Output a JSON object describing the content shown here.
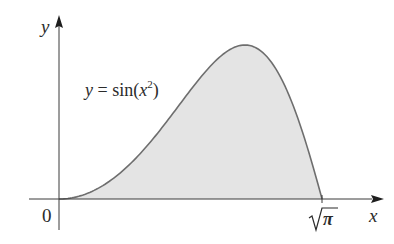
{
  "chart_data": {
    "type": "area",
    "title": "",
    "function_label": "y = sin(x²)",
    "xlabel": "x",
    "ylabel": "y",
    "x_ticks": [
      {
        "value": 0,
        "label": "0"
      },
      {
        "value": 1.7725,
        "label": "√π"
      }
    ],
    "xlim": [
      -0.2,
      2.2
    ],
    "ylim": [
      -0.2,
      1.2
    ],
    "grid": false,
    "legend": null,
    "shaded_region": {
      "from": 0,
      "to": 1.7725,
      "fill": "#e4e4e4"
    },
    "x": [
      0,
      0.2,
      0.4,
      0.6,
      0.8,
      1.0,
      1.2,
      1.2533,
      1.4,
      1.6,
      1.7725
    ],
    "values": [
      0,
      0.04,
      0.159,
      0.352,
      0.597,
      0.841,
      0.991,
      1.0,
      0.925,
      0.549,
      0
    ]
  },
  "labels": {
    "y_axis": "y",
    "x_axis": "x",
    "origin": "0",
    "sqrt": "√",
    "pi": "π",
    "eq_y": "y",
    "eq_eq": " = sin(",
    "eq_x": "x",
    "eq_sup": "2",
    "eq_close": ")"
  },
  "colors": {
    "fill": "#e4e4e4",
    "curve": "#6e6e6e",
    "axis": "#3a3a3a"
  }
}
